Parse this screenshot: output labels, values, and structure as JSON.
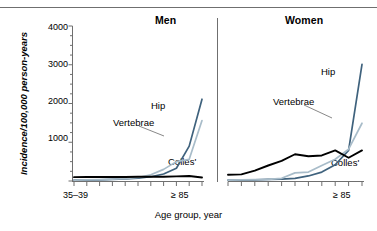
{
  "figure": {
    "ylabel": "Incidence/100,000 person-years",
    "xlabel": "Age group, year",
    "panel_men_title": "Men",
    "panel_women_title": "Women"
  },
  "axis": {
    "y_ticks": [
      "1000",
      "2000",
      "3000",
      "4000"
    ],
    "x_first": "35–39",
    "x_last": "≥ 85"
  },
  "labels": {
    "hip": "Hip",
    "vertebrae": "Vertebrae",
    "colles": "Colles'"
  },
  "colors": {
    "hip": "#3f627d",
    "vertebrae": "#a8bcc9",
    "colles": "#000000",
    "axis": "#6f6f6f"
  },
  "chart_data": {
    "type": "line",
    "title": "",
    "xlabel": "Age group, year",
    "ylabel": "Incidence/100,000 person-years",
    "ylim": [
      0,
      4000
    ],
    "y_ticks": [
      0,
      1000,
      2000,
      3000,
      4000
    ],
    "y_minor_tick_step": 250,
    "grid": false,
    "legend": "inline-annotations",
    "categories": [
      "35–39",
      "40–44",
      "45–49",
      "50–54",
      "55–59",
      "60–64",
      "65–69",
      "70–74",
      "75–79",
      "80–84",
      "≥ 85"
    ],
    "panels": [
      {
        "name": "Men",
        "series": [
          {
            "name": "Hip",
            "values": [
              20,
              25,
              30,
              40,
              55,
              75,
              110,
              180,
              330,
              900,
              2110
            ]
          },
          {
            "name": "Vertebrae",
            "values": [
              25,
              30,
              35,
              45,
              60,
              90,
              160,
              300,
              500,
              560,
              1560
            ]
          },
          {
            "name": "Colles'",
            "values": [
              100,
              105,
              105,
              105,
              105,
              110,
              110,
              110,
              120,
              130,
              90
            ]
          }
        ]
      },
      {
        "name": "Women",
        "series": [
          {
            "name": "Hip",
            "values": [
              20,
              25,
              30,
              40,
              50,
              70,
              130,
              230,
              420,
              790,
              3010
            ]
          },
          {
            "name": "Vertebrae",
            "values": [
              25,
              30,
              35,
              40,
              70,
              210,
              230,
              400,
              560,
              820,
              1490
            ]
          },
          {
            "name": "Colles'",
            "values": [
              160,
              170,
              270,
              400,
              520,
              690,
              640,
              660,
              790,
              600,
              790
            ]
          }
        ]
      }
    ]
  }
}
